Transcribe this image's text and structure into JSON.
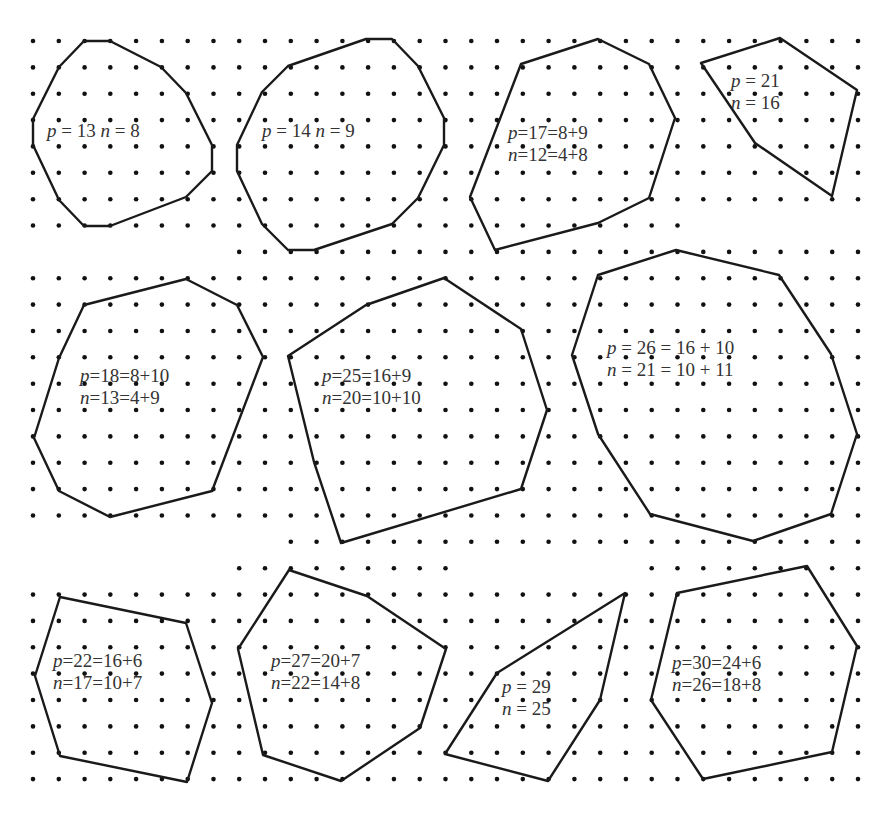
{
  "figure": {
    "grid": {
      "dot_color": "#111111",
      "line_color": "#1a1a1a",
      "x0": 33,
      "dx": 25.78,
      "y0": 41,
      "dy": 26.36,
      "rows": [
        {
          "r": 0,
          "c": [
            0,
            32
          ]
        },
        {
          "r": 1,
          "c": [
            0,
            32
          ]
        },
        {
          "r": 2,
          "c": [
            0,
            32
          ]
        },
        {
          "r": 3,
          "c": [
            0,
            32
          ]
        },
        {
          "r": 4,
          "c": [
            0,
            32
          ]
        },
        {
          "r": 5,
          "c": [
            0,
            32
          ]
        },
        {
          "r": 6,
          "c": [
            0,
            32
          ]
        },
        {
          "r": 7,
          "c": [
            0,
            25
          ]
        },
        {
          "r": 8,
          "c": [
            8,
            32
          ]
        },
        {
          "r": 9,
          "c": [
            0,
            32
          ]
        },
        {
          "r": 10,
          "c": [
            0,
            32
          ]
        },
        {
          "r": 11,
          "c": [
            0,
            32
          ]
        },
        {
          "r": 12,
          "c": [
            0,
            32
          ]
        },
        {
          "r": 13,
          "c": [
            0,
            32
          ]
        },
        {
          "r": 14,
          "c": [
            0,
            32
          ]
        },
        {
          "r": 15,
          "c": [
            0,
            32
          ]
        },
        {
          "r": 16,
          "c": [
            0,
            32
          ]
        },
        {
          "r": 17,
          "c": [
            0,
            32
          ]
        },
        {
          "r": 18,
          "c": [
            0,
            32
          ]
        },
        {
          "r": 19,
          "c": [
            10,
            32
          ]
        },
        {
          "r": 20,
          "c": [
            8,
            16
          ],
          "c2": [
            24,
            32
          ]
        },
        {
          "r": 21,
          "c": [
            0,
            32
          ]
        },
        {
          "r": 22,
          "c": [
            0,
            32
          ]
        },
        {
          "r": 23,
          "c": [
            0,
            32
          ]
        },
        {
          "r": 24,
          "c": [
            0,
            32
          ]
        },
        {
          "r": 25,
          "c": [
            0,
            32
          ]
        },
        {
          "r": 26,
          "c": [
            0,
            32
          ]
        },
        {
          "r": 27,
          "c": [
            0,
            32
          ]
        },
        {
          "r": 28,
          "c": [
            0,
            32
          ]
        }
      ]
    },
    "polygons": [
      {
        "id": "poly-p13",
        "label_lines": [
          "p = 13 n = 8"
        ],
        "label_pos": [
          47,
          120
        ],
        "vertices": [
          [
            2,
            0
          ],
          [
            3,
            0
          ],
          [
            5,
            1
          ],
          [
            6,
            2
          ],
          [
            7,
            4
          ],
          [
            7,
            5
          ],
          [
            6,
            6
          ],
          [
            3,
            7
          ],
          [
            2,
            7
          ],
          [
            1,
            6
          ],
          [
            0,
            4
          ],
          [
            0,
            3
          ],
          [
            1,
            1
          ]
        ]
      },
      {
        "id": "poly-p14",
        "label_lines": [
          "p = 14 n = 9"
        ],
        "label_pos": [
          262,
          120
        ],
        "vertices": [
          [
            14,
            0
          ],
          [
            15,
            0
          ],
          [
            16,
            1
          ],
          [
            17,
            3
          ],
          [
            17,
            4
          ],
          [
            16,
            6
          ],
          [
            15,
            7
          ],
          [
            12,
            8
          ],
          [
            11,
            8
          ],
          [
            10,
            7
          ],
          [
            9,
            5
          ],
          [
            9,
            4
          ],
          [
            10,
            2
          ],
          [
            11,
            1
          ]
        ]
      },
      {
        "id": "poly-p17",
        "label_lines": [
          "p=17=8+9",
          "n=12=4+8"
        ],
        "label_pos": [
          508,
          122
        ],
        "vertices": [
          [
            22,
            0
          ],
          [
            24,
            1
          ],
          [
            25,
            3
          ],
          [
            24,
            6
          ],
          [
            22,
            7
          ],
          [
            18,
            8
          ],
          [
            17,
            6
          ],
          [
            19,
            1
          ]
        ]
      },
      {
        "id": "poly-p21",
        "label_lines": [
          "p = 21",
          "n = 16"
        ],
        "label_pos": [
          731,
          70
        ],
        "vertices": [
          [
            26,
            1
          ],
          [
            29,
            0
          ],
          [
            32,
            2
          ],
          [
            31,
            6
          ],
          [
            28,
            4
          ]
        ]
      },
      {
        "id": "poly-p18",
        "label_lines": [
          "p=18=8+10",
          "n=13=4+9"
        ],
        "label_pos": [
          80,
          365
        ],
        "vertices": [
          [
            6,
            9
          ],
          [
            8,
            10
          ],
          [
            9,
            12
          ],
          [
            7,
            17
          ],
          [
            3,
            18
          ],
          [
            1,
            17
          ],
          [
            0,
            15
          ],
          [
            2,
            11
          ],
          [
            3,
            10
          ]
        ]
      },
      {
        "id": "poly-p25",
        "label_lines": [
          "p=25=16+9",
          "n=20=10+10"
        ],
        "label_pos": [
          322,
          365
        ],
        "vertices": [
          [
            18,
            9
          ],
          [
            21,
            11
          ],
          [
            22,
            14
          ],
          [
            21,
            17
          ],
          [
            12,
            20
          ],
          [
            10,
            16
          ],
          [
            9,
            12
          ],
          [
            13,
            10
          ]
        ]
      },
      {
        "id": "poly-p26",
        "label_lines": [
          "p = 26 = 16 + 10",
          "n = 21 = 10 + 11"
        ],
        "label_pos": [
          607,
          337
        ],
        "vertices": [
          [
            24,
            9
          ],
          [
            28,
            10
          ],
          [
            30,
            12
          ],
          [
            31,
            15
          ],
          [
            30,
            18
          ],
          [
            27,
            19
          ],
          [
            23,
            18
          ],
          [
            20,
            16
          ],
          [
            20,
            15
          ],
          [
            19,
            12
          ],
          [
            20,
            10
          ]
        ]
      },
      {
        "id": "poly-p22",
        "label_lines": [
          "p=22=16+6",
          "n=17=10+7"
        ],
        "label_pos": [
          53,
          650
        ],
        "vertices": [
          [
            1,
            22
          ],
          [
            6,
            23
          ],
          [
            7,
            26
          ],
          [
            6,
            28
          ],
          [
            1,
            27
          ],
          [
            0,
            25
          ]
        ]
      },
      {
        "id": "poly-p27",
        "label_lines": [
          "p=27=20+7",
          "n=22=14+8"
        ],
        "label_pos": [
          271,
          650
        ],
        "vertices": [
          [
            10,
            21
          ],
          [
            13,
            22
          ],
          [
            16,
            24
          ],
          [
            15,
            27
          ],
          [
            12,
            29
          ],
          [
            9,
            28
          ],
          [
            8,
            24
          ]
        ]
      },
      {
        "id": "poly-p29",
        "label_lines": [
          "p = 29",
          "n = 25"
        ],
        "label_pos": [
          502,
          676
        ],
        "vertices": [
          [
            23,
            22
          ],
          [
            22,
            27
          ],
          [
            20,
            30
          ],
          [
            16,
            29
          ],
          [
            18,
            25
          ],
          [
            15,
            28
          ]
        ]
      },
      {
        "id": "poly-p30",
        "label_lines": [
          "p=30=24+6",
          "n=26=18+8"
        ],
        "label_pos": [
          672,
          652
        ],
        "vertices": [
          [
            25,
            22
          ],
          [
            31,
            21
          ],
          [
            33,
            24
          ],
          [
            32,
            29
          ],
          [
            27,
            30
          ],
          [
            25,
            28
          ],
          [
            24,
            26
          ]
        ]
      }
    ]
  }
}
